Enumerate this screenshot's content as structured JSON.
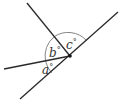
{
  "diagram": {
    "type": "angles-at-a-point",
    "stroke_color": "#2a2a2a",
    "arc_color": "#555555",
    "vertex": {
      "x": 70,
      "y": 56
    },
    "lines": [
      {
        "name": "long-diagonal",
        "x1": 20,
        "y1": 99,
        "x2": 118,
        "y2": 12
      },
      {
        "name": "upper-left-ray",
        "x1": 27,
        "y1": 3,
        "x2": 70,
        "y2": 56
      },
      {
        "name": "left-ray",
        "x1": 4,
        "y1": 69,
        "x2": 70,
        "y2": 56
      }
    ],
    "angles": [
      {
        "label": "a",
        "degree_symbol": "°"
      },
      {
        "label": "b",
        "degree_symbol": "°"
      },
      {
        "label": "c",
        "degree_symbol": "°"
      }
    ]
  }
}
